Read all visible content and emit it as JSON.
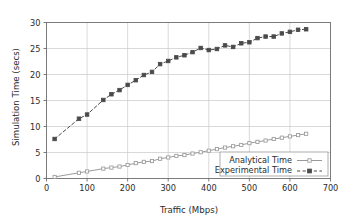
{
  "chart_data": {
    "type": "line",
    "title": "",
    "xlabel": "Traffic (Mbps)",
    "ylabel": "Simulation Time (secs)",
    "xlim": [
      0,
      700
    ],
    "ylim": [
      0,
      30
    ],
    "xticks": [
      0,
      100,
      200,
      300,
      400,
      500,
      600,
      700
    ],
    "yticks": [
      0,
      5,
      10,
      15,
      20,
      25,
      30
    ],
    "xtick_labels": [
      "0",
      "100",
      "200",
      "300",
      "400",
      "500",
      "600",
      "700"
    ],
    "ytick_labels": [
      "0",
      "5",
      "10",
      "15",
      "20",
      "25",
      "30"
    ],
    "grid": true,
    "grid_color": "#c8c8c8",
    "legend_position": "lower right",
    "series": [
      {
        "name": "Analytical Time",
        "color": "#9a9a9a",
        "marker": "open-square",
        "linestyle": "solid",
        "x": [
          20,
          80,
          100,
          140,
          160,
          180,
          200,
          220,
          240,
          260,
          280,
          300,
          320,
          340,
          360,
          380,
          400,
          420,
          440,
          460,
          480,
          500,
          520,
          540,
          560,
          580,
          600,
          620,
          640
        ],
        "y": [
          0.3,
          1.1,
          1.35,
          1.9,
          2.1,
          2.3,
          2.6,
          2.95,
          3.2,
          3.35,
          3.8,
          4.05,
          4.35,
          4.5,
          4.8,
          5.05,
          5.35,
          5.65,
          5.95,
          6.2,
          6.45,
          6.8,
          7.05,
          7.3,
          7.6,
          7.85,
          8.1,
          8.35,
          8.6
        ]
      },
      {
        "name": "Experimental Time",
        "color": "#4a4a4a",
        "marker": "filled-square",
        "linestyle": "dashed",
        "x": [
          20,
          80,
          100,
          140,
          160,
          180,
          200,
          220,
          240,
          260,
          280,
          300,
          320,
          340,
          360,
          380,
          400,
          420,
          440,
          460,
          480,
          500,
          520,
          540,
          560,
          580,
          600,
          620,
          640
        ],
        "y": [
          7.6,
          11.5,
          12.3,
          15.1,
          16.2,
          17.0,
          18.0,
          18.9,
          19.9,
          20.5,
          22.0,
          22.6,
          23.3,
          23.7,
          24.3,
          25.1,
          24.7,
          24.9,
          25.6,
          25.3,
          26.0,
          26.2,
          27.0,
          27.3,
          27.3,
          27.9,
          28.2,
          28.6,
          28.7
        ]
      }
    ]
  },
  "legend": {
    "entries": [
      {
        "label": "Analytical Time"
      },
      {
        "label": "Experimental Time"
      }
    ]
  }
}
